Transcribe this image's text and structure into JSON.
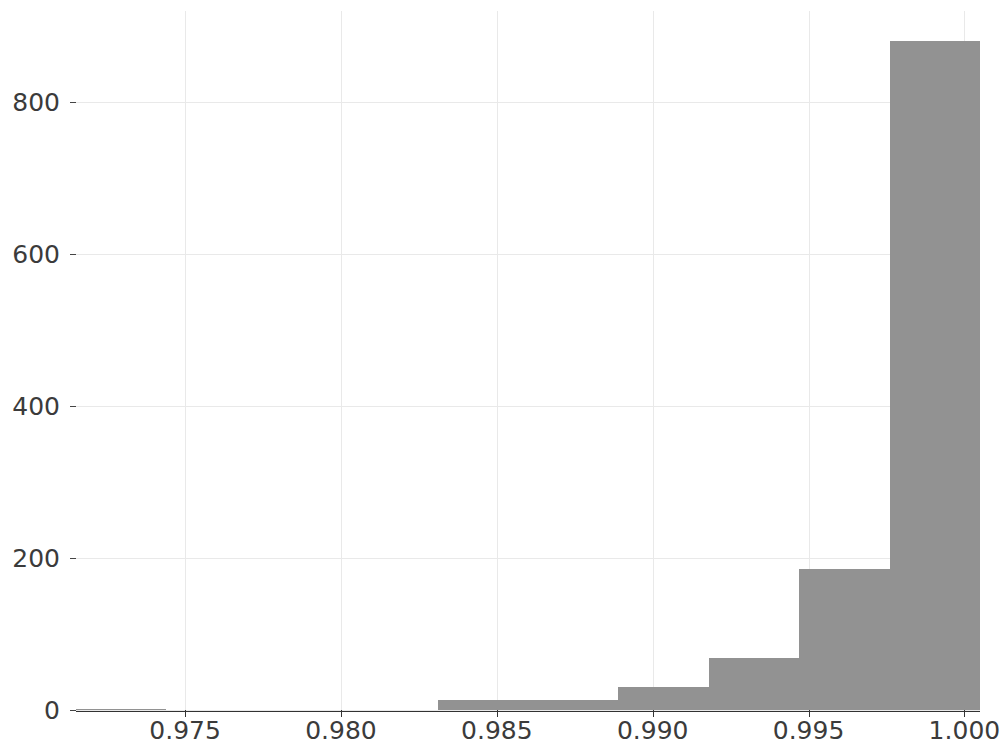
{
  "chart": {
    "type": "histogram",
    "title": "",
    "xlabel": "",
    "ylabel": ""
  },
  "axes": {
    "x_ticks": [
      "0.975",
      "0.980",
      "0.985",
      "0.990",
      "0.995",
      "1.000"
    ],
    "y_ticks": [
      "0",
      "200",
      "400",
      "600",
      "800"
    ]
  },
  "chart_data": {
    "type": "bar",
    "title": "",
    "subtitle": "",
    "xlabel": "",
    "ylabel": "",
    "orientation": "vertical",
    "grid": true,
    "legend": null,
    "legend_position": "none",
    "xlim": [
      0.9715,
      1.0005
    ],
    "ylim": [
      0,
      920
    ],
    "xtick_labels": [
      "0.975",
      "0.980",
      "0.985",
      "0.990",
      "0.995",
      "1.000"
    ],
    "xtick_values": [
      0.975,
      0.98,
      0.985,
      0.99,
      0.995,
      1.0
    ],
    "ytick_labels": [
      "0",
      "200",
      "400",
      "600",
      "800"
    ],
    "ytick_values": [
      0,
      200,
      400,
      600,
      800
    ],
    "bar_color": "#929292",
    "bin_edges": [
      0.9715,
      0.9744,
      0.9773,
      0.9802,
      0.9831,
      0.986,
      0.9889,
      0.9918,
      0.9947,
      0.9976,
      1.0005
    ],
    "categories": [
      "0.9715-0.9744",
      "0.9744-0.9773",
      "0.9773-0.9802",
      "0.9802-0.9831",
      "0.9831-0.9860",
      "0.9860-0.9889",
      "0.9889-0.9918",
      "0.9918-0.9947",
      "0.9947-0.9976",
      "0.9976-1.0005"
    ],
    "values": [
      1,
      0,
      0,
      0,
      13,
      13,
      30,
      68,
      186,
      880
    ]
  }
}
